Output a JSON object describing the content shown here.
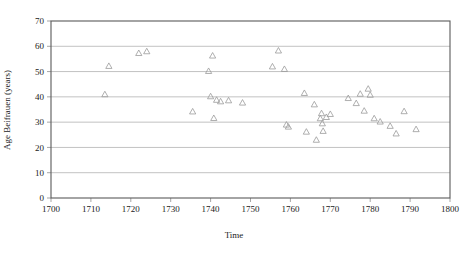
{
  "chart_data": {
    "type": "scatter",
    "title": "",
    "xlabel": "Time",
    "ylabel": "Age Beifrauen (years)",
    "xlim": [
      1700,
      1800
    ],
    "ylim": [
      0,
      70
    ],
    "xticks": [
      1700,
      1710,
      1720,
      1730,
      1740,
      1750,
      1760,
      1770,
      1780,
      1790,
      1800
    ],
    "yticks": [
      0,
      10,
      20,
      30,
      40,
      50,
      60,
      70
    ],
    "grid": "horizontal",
    "legend": "none",
    "marker": "open-triangle",
    "marker_color": "#9a9a9a",
    "series": [
      {
        "name": "Age Beifrauen",
        "points": [
          [
            1713.5,
            41.0
          ],
          [
            1714.5,
            52.2
          ],
          [
            1722.0,
            57.3
          ],
          [
            1724.0,
            58.0
          ],
          [
            1735.5,
            34.2
          ],
          [
            1739.5,
            50.2
          ],
          [
            1740.0,
            40.2
          ],
          [
            1740.5,
            56.3
          ],
          [
            1740.8,
            31.6
          ],
          [
            1741.5,
            38.8
          ],
          [
            1742.5,
            38.2
          ],
          [
            1744.5,
            38.6
          ],
          [
            1748.0,
            37.7
          ],
          [
            1755.5,
            52.0
          ],
          [
            1757.0,
            58.3
          ],
          [
            1758.5,
            51.0
          ],
          [
            1759.0,
            29.0
          ],
          [
            1759.5,
            28.2
          ],
          [
            1763.5,
            41.5
          ],
          [
            1764.0,
            26.2
          ],
          [
            1766.0,
            37.0
          ],
          [
            1766.5,
            23.0
          ],
          [
            1767.5,
            31.5
          ],
          [
            1767.8,
            33.5
          ],
          [
            1768.0,
            29.5
          ],
          [
            1768.2,
            26.5
          ],
          [
            1769.0,
            32.0
          ],
          [
            1770.0,
            33.2
          ],
          [
            1774.5,
            39.5
          ],
          [
            1776.5,
            37.5
          ],
          [
            1777.5,
            41.2
          ],
          [
            1778.5,
            34.5
          ],
          [
            1779.5,
            43.2
          ],
          [
            1780.0,
            40.8
          ],
          [
            1781.0,
            31.5
          ],
          [
            1782.5,
            30.2
          ],
          [
            1785.0,
            28.5
          ],
          [
            1786.5,
            25.5
          ],
          [
            1788.5,
            34.3
          ],
          [
            1791.5,
            27.2
          ]
        ]
      }
    ]
  }
}
